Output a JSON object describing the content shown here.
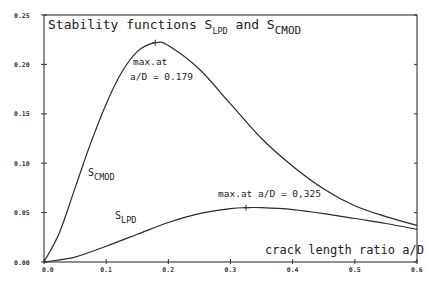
{
  "chart_data": {
    "type": "line",
    "title_parts": {
      "prefix": "Stability functions S",
      "sub1": "LPD",
      "mid": " and S",
      "sub2": "CMOD"
    },
    "xlabel": "crack length ratio a/D",
    "ylabel": "",
    "xlim": [
      0.0,
      0.6
    ],
    "ylim": [
      0.0,
      0.25
    ],
    "x_ticks": [
      0.0,
      0.1,
      0.2,
      0.3,
      0.4,
      0.5,
      0.6
    ],
    "x_tick_labels": [
      "0.0",
      "0.1",
      "0.2",
      "0.3",
      "0.4",
      "0.5",
      "0.6"
    ],
    "y_ticks": [
      0.0,
      0.05,
      0.1,
      0.15,
      0.2,
      0.25
    ],
    "y_tick_labels": [
      "0.00",
      "0.05",
      "0.10",
      "0.15",
      "0.20",
      "0.25"
    ],
    "grid": false,
    "legend": "none (inline curve labels)",
    "series": [
      {
        "name": "S_CMOD",
        "label_base": "S",
        "label_sub": "CMOD",
        "x": [
          0.0,
          0.025,
          0.05,
          0.075,
          0.1,
          0.125,
          0.15,
          0.179,
          0.2,
          0.25,
          0.3,
          0.35,
          0.4,
          0.45,
          0.5,
          0.55,
          0.6
        ],
        "values": [
          0.0,
          0.03,
          0.075,
          0.12,
          0.16,
          0.192,
          0.213,
          0.222,
          0.219,
          0.195,
          0.16,
          0.125,
          0.097,
          0.074,
          0.057,
          0.046,
          0.037
        ],
        "max": {
          "x": 0.179,
          "y": 0.222
        }
      },
      {
        "name": "S_LPD",
        "label_base": "S",
        "label_sub": "LPD",
        "x": [
          0.0,
          0.05,
          0.1,
          0.15,
          0.2,
          0.25,
          0.3,
          0.325,
          0.35,
          0.4,
          0.45,
          0.5,
          0.55,
          0.6
        ],
        "values": [
          0.0,
          0.005,
          0.016,
          0.028,
          0.04,
          0.049,
          0.054,
          0.055,
          0.055,
          0.053,
          0.049,
          0.044,
          0.039,
          0.033
        ],
        "max": {
          "x": 0.325,
          "y": 0.055
        }
      }
    ],
    "annotations": [
      {
        "text_line1": "max.at",
        "text_line2": "a/D = 0.179",
        "target": "S_CMOD peak"
      },
      {
        "text": "max.at a/D = 0,325",
        "target": "S_LPD peak"
      }
    ]
  }
}
